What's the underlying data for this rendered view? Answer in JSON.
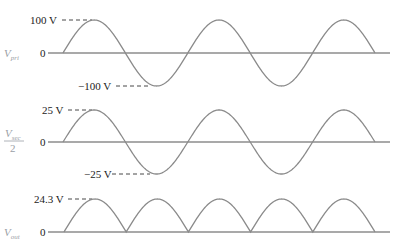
{
  "panels": [
    {
      "signal_label": "V",
      "signal_sub": "pri",
      "zero_label": "0",
      "peak_label": "100 V",
      "trough_label": "−100 V",
      "type": "sine"
    },
    {
      "signal_label": "V",
      "signal_sub": "sec",
      "signal_denominator": "2",
      "zero_label": "0",
      "peak_label": "25 V",
      "trough_label": "−25 V",
      "type": "sine"
    },
    {
      "signal_label": "V",
      "signal_sub": "out",
      "zero_label": "0",
      "peak_label": "24.3 V",
      "type": "full-wave-rectified"
    }
  ],
  "colors": {
    "wave": "#8a8a8a",
    "axis": "#555555",
    "signal_label": "#9aa0a6"
  }
}
